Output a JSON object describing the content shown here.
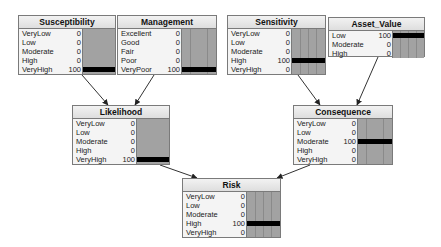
{
  "diagram": {
    "type": "bayesian-network",
    "nodes": [
      {
        "id": "susceptibility",
        "title": "Susceptibility",
        "box": {
          "x": 18,
          "y": 15,
          "w": 98,
          "h": 60
        },
        "states": [
          {
            "label": "VeryLow",
            "value": "0",
            "pct": 0
          },
          {
            "label": "Low",
            "value": "0",
            "pct": 0
          },
          {
            "label": "Moderate",
            "value": "0",
            "pct": 0
          },
          {
            "label": "High",
            "value": "0",
            "pct": 0
          },
          {
            "label": "VeryHigh",
            "value": "100",
            "pct": 100
          }
        ]
      },
      {
        "id": "management",
        "title": "Management",
        "box": {
          "x": 117,
          "y": 15,
          "w": 100,
          "h": 60
        },
        "states": [
          {
            "label": "Excellent",
            "value": "0",
            "pct": 0
          },
          {
            "label": "Good",
            "value": "0",
            "pct": 0
          },
          {
            "label": "Fair",
            "value": "0",
            "pct": 0
          },
          {
            "label": "Poor",
            "value": "0",
            "pct": 0
          },
          {
            "label": "VeryPoor",
            "value": "100",
            "pct": 100
          }
        ]
      },
      {
        "id": "sensitivity",
        "title": "Sensitivity",
        "box": {
          "x": 227,
          "y": 15,
          "w": 99,
          "h": 60
        },
        "states": [
          {
            "label": "VeryLow",
            "value": "0",
            "pct": 0
          },
          {
            "label": "Low",
            "value": "0",
            "pct": 0
          },
          {
            "label": "Moderate",
            "value": "0",
            "pct": 0
          },
          {
            "label": "High",
            "value": "100",
            "pct": 100
          },
          {
            "label": "VeryHigh",
            "value": "0",
            "pct": 0
          }
        ]
      },
      {
        "id": "asset_value",
        "title": "Asset_Value",
        "box": {
          "x": 328,
          "y": 17,
          "w": 97,
          "h": 40
        },
        "states": [
          {
            "label": "Low",
            "value": "100",
            "pct": 100
          },
          {
            "label": "Moderate",
            "value": "0",
            "pct": 0
          },
          {
            "label": "High",
            "value": "0",
            "pct": 0
          }
        ]
      },
      {
        "id": "likelihood",
        "title": "Likelihood",
        "box": {
          "x": 72,
          "y": 105,
          "w": 98,
          "h": 60
        },
        "states": [
          {
            "label": "VeryLow",
            "value": "0",
            "pct": 0
          },
          {
            "label": "Low",
            "value": "0",
            "pct": 0
          },
          {
            "label": "Moderate",
            "value": "0",
            "pct": 0
          },
          {
            "label": "High",
            "value": "0",
            "pct": 0
          },
          {
            "label": "VeryHigh",
            "value": "100",
            "pct": 100
          }
        ]
      },
      {
        "id": "consequence",
        "title": "Consequence",
        "box": {
          "x": 293,
          "y": 105,
          "w": 100,
          "h": 60
        },
        "states": [
          {
            "label": "VeryLow",
            "value": "0",
            "pct": 0
          },
          {
            "label": "Low",
            "value": "0",
            "pct": 0
          },
          {
            "label": "Moderate",
            "value": "100",
            "pct": 100
          },
          {
            "label": "High",
            "value": "0",
            "pct": 0
          },
          {
            "label": "VeryHigh",
            "value": "0",
            "pct": 0
          }
        ]
      },
      {
        "id": "risk",
        "title": "Risk",
        "box": {
          "x": 182,
          "y": 178,
          "w": 99,
          "h": 60
        },
        "states": [
          {
            "label": "VeryLow",
            "value": "0",
            "pct": 0
          },
          {
            "label": "Low",
            "value": "0",
            "pct": 0
          },
          {
            "label": "Moderate",
            "value": "0",
            "pct": 0
          },
          {
            "label": "High",
            "value": "100",
            "pct": 100
          },
          {
            "label": "VeryHigh",
            "value": "0",
            "pct": 0
          }
        ]
      }
    ],
    "edges": [
      {
        "from": "susceptibility",
        "to": "likelihood",
        "x1": 82,
        "y1": 75,
        "x2": 108,
        "y2": 105
      },
      {
        "from": "management",
        "to": "likelihood",
        "x1": 154,
        "y1": 75,
        "x2": 135,
        "y2": 105
      },
      {
        "from": "sensitivity",
        "to": "consequence",
        "x1": 298,
        "y1": 75,
        "x2": 320,
        "y2": 105
      },
      {
        "from": "asset_value",
        "to": "consequence",
        "x1": 378,
        "y1": 57,
        "x2": 357,
        "y2": 105
      },
      {
        "from": "likelihood",
        "to": "risk",
        "x1": 160,
        "y1": 165,
        "x2": 197,
        "y2": 178
      },
      {
        "from": "consequence",
        "to": "risk",
        "x1": 310,
        "y1": 165,
        "x2": 277,
        "y2": 178
      }
    ],
    "colors": {
      "edge": "#333333",
      "bar_fill": "#000000",
      "bar_bg": "#a2a2a2",
      "node_border": "#7a7a7a",
      "node_body": "#f4f4f4",
      "node_header": "#e4e4e4"
    }
  }
}
